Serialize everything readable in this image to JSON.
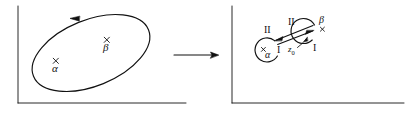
{
  "figure": {
    "type": "contour-deformation-diagram",
    "panels": [
      {
        "id": "left-panel",
        "name": "original-contour-panel",
        "axes": {
          "vertical": true,
          "horizontal": true
        },
        "contour": {
          "shape": "ellipse",
          "orientation_deg": -22,
          "direction_arrow": "leftward-at-top"
        },
        "points": [
          {
            "marker": "×",
            "label": "α",
            "name": "point-alpha"
          },
          {
            "marker": "×",
            "label": "β",
            "name": "point-beta"
          }
        ]
      },
      {
        "id": "right-panel",
        "name": "deformed-contour-panel",
        "axes": {
          "vertical": true,
          "horizontal": true
        },
        "contour": {
          "shape": "dumbbell",
          "loops": 2
        },
        "points": [
          {
            "marker": "×",
            "label": "α",
            "name": "point-alpha"
          },
          {
            "marker": "×",
            "label": "β",
            "name": "point-beta"
          }
        ],
        "path_labels": [
          {
            "text": "II",
            "name": "path-label-two-left"
          },
          {
            "text": "II",
            "name": "path-label-two-right"
          },
          {
            "text": "I",
            "name": "path-label-one-left"
          },
          {
            "text": "I",
            "name": "path-label-one-right"
          }
        ],
        "basepoint": {
          "text": "z",
          "subscript": "0",
          "name": "basepoint-z0"
        }
      }
    ],
    "transform_arrow": {
      "direction": "right",
      "name": "transform-arrow"
    }
  },
  "colors": {
    "ink": "#111111",
    "background": "#ffffff"
  }
}
